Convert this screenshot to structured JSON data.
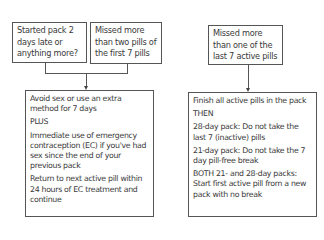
{
  "flowchart": {
    "left_branch": {
      "condition_boxes": [
        {
          "text": "Started pack 2 days late or anything more?"
        },
        {
          "text": "Missed more than two pills of the first 7 pills"
        }
      ],
      "action_box": {
        "paragraphs": [
          "Avoid sex or use an extra method for 7 days",
          "PLUS",
          "Immediate use of emergency contraception (EC) if you've had sex since the end of your previous pack",
          "Return to next active pill within 24 hours of EC treatment and continue"
        ]
      }
    },
    "right_branch": {
      "condition_boxes": [
        {
          "text": "Missed more than one of the last 7 active pills"
        }
      ],
      "action_box": {
        "paragraphs": [
          "Finish all active pills in the pack",
          "THEN",
          "28-day pack: Do not take the last 7 (inactive) pills",
          "21-day pack: Do not take the 7 day pill-free break",
          "BOTH 21- and 28-day packs: Start first active pill from a new pack with no break"
        ]
      }
    }
  },
  "colors": {
    "border": "#555555",
    "text": "#3a3a3a",
    "background": "#ffffff"
  }
}
